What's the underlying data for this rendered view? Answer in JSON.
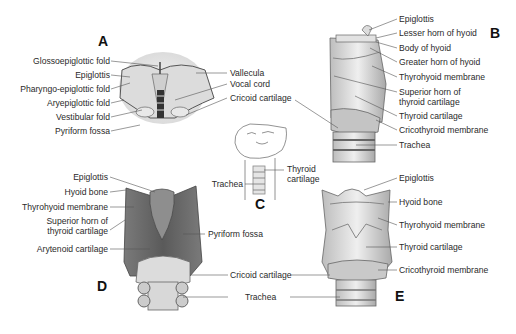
{
  "panels": {
    "A": {
      "letter": "A",
      "labels_left": [
        "Glossoepiglottic fold",
        "Epiglottis",
        "Pharyngo-epiglottic fold",
        "Aryepiglottic fold",
        "Vestibular fold",
        "Pyriform fossa"
      ],
      "labels_right": [
        "Vallecula",
        "Vocal cord",
        "Cricoid cartilage"
      ]
    },
    "B": {
      "letter": "B",
      "labels_right": [
        "Epiglottis",
        "Lesser horn of hyoid",
        "Body of hyoid",
        "Greater horn of hyoid",
        "Thyrohyoid membrane",
        "Superior horn of",
        "thyroid cartilage",
        "Thyroid cartilage",
        "Cricothyroid membrane",
        "Trachea"
      ]
    },
    "C": {
      "letter": "C",
      "labels": [
        "Thyroid",
        "cartilage",
        "Trachea"
      ]
    },
    "D": {
      "letter": "D",
      "labels_left": [
        "Epiglottis",
        "Hyoid bone",
        "Thyrohyoid membrane",
        "Superior horn of",
        "thyroid cartilage",
        "Arytenoid cartilage"
      ],
      "labels_right": [
        "Pyriform fossa"
      ],
      "labels_shared": [
        "Cricoid cartilage",
        "Trachea"
      ]
    },
    "E": {
      "letter": "E",
      "labels_right": [
        "Epiglottis",
        "Hyoid bone",
        "Thyrohyoid membrane",
        "Thyroid cartilage",
        "Cricothyroid membrane"
      ]
    }
  },
  "colors": {
    "ink": "#2a2a2a",
    "leader": "#555555",
    "light_tissue": "#d6d6d6",
    "dark_tissue": "#6a6a6a",
    "mid_tissue": "#a8a8a8"
  }
}
